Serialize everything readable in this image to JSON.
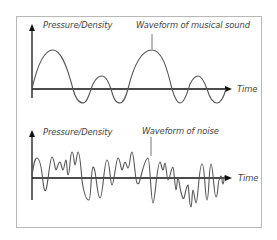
{
  "figure": {
    "panels": [
      {
        "id": "musical",
        "y_axis_label": "Pressure/Density",
        "x_axis_label": "Time",
        "annotation": "Waveform of musical sound"
      },
      {
        "id": "noise",
        "y_axis_label": "Pressure/Density",
        "x_axis_label": "Time",
        "annotation": "Waveform of noise"
      }
    ],
    "colors": {
      "axis": "#111111",
      "waveform": "#555555",
      "text": "#444444",
      "frame": "#b8b8b8"
    }
  }
}
